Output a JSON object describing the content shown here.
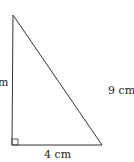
{
  "diagram": {
    "type": "right-triangle",
    "labels": {
      "left_side": "m",
      "hypotenuse": "9 cm",
      "base": "4 cm"
    },
    "colors": {
      "stroke": "#333333",
      "text": "#222222",
      "background": "#ffffff"
    }
  }
}
